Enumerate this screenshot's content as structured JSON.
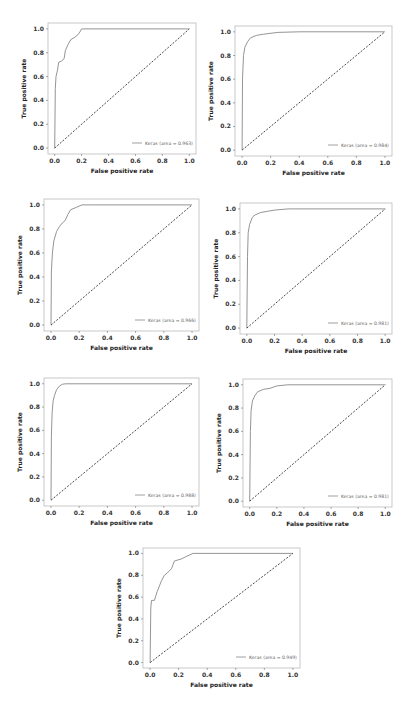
{
  "figure": {
    "x_label": "False positive rate",
    "y_label": "True positive rate",
    "x_ticks": [
      "0.0",
      "0.2",
      "0.4",
      "0.6",
      "0.8",
      "1.0"
    ],
    "y_ticks": [
      "0.0",
      "0.2",
      "0.4",
      "0.6",
      "0.8",
      "1.0"
    ],
    "line_color": "#888888",
    "diagonal_color": "#333333",
    "frame_color": "#bbbbbb"
  },
  "chart_data": [
    {
      "type": "line",
      "title": "",
      "xlabel": "False positive rate",
      "ylabel": "True positive rate",
      "xlim": [
        0,
        1
      ],
      "ylim": [
        0,
        1
      ],
      "legend": "Keras (area = 0.963)",
      "legend_position": "lower right",
      "frame": {
        "left": 48,
        "top": 23,
        "width": 148,
        "height": 131
      },
      "series": [
        {
          "name": "Keras (area = 0.963)",
          "x": [
            0,
            0.005,
            0.01,
            0.02,
            0.03,
            0.05,
            0.07,
            0.08,
            0.1,
            0.12,
            0.15,
            0.18,
            0.2,
            1.0
          ],
          "y": [
            0,
            0.5,
            0.6,
            0.65,
            0.72,
            0.73,
            0.75,
            0.82,
            0.87,
            0.91,
            0.93,
            0.96,
            1.0,
            1.0
          ]
        },
        {
          "name": "chance",
          "x": [
            0,
            1
          ],
          "y": [
            0,
            1
          ],
          "style": "dashed"
        }
      ]
    },
    {
      "type": "line",
      "title": "",
      "xlabel": "False positive rate",
      "ylabel": "True positive rate",
      "xlim": [
        0,
        1
      ],
      "ylim": [
        0,
        1
      ],
      "legend": "Keras (area = 0.984)",
      "legend_position": "lower right",
      "frame": {
        "left": 235,
        "top": 26,
        "width": 157,
        "height": 130
      },
      "series": [
        {
          "name": "Keras (area = 0.984)",
          "x": [
            0,
            0.003,
            0.01,
            0.02,
            0.04,
            0.06,
            0.1,
            0.15,
            0.25,
            0.4,
            1.0
          ],
          "y": [
            0,
            0.6,
            0.8,
            0.87,
            0.92,
            0.95,
            0.97,
            0.98,
            0.995,
            1.0,
            1.0
          ]
        },
        {
          "name": "chance",
          "x": [
            0,
            1
          ],
          "y": [
            0,
            1
          ],
          "style": "dashed"
        }
      ]
    },
    {
      "type": "line",
      "title": "",
      "xlabel": "False positive rate",
      "ylabel": "True positive rate",
      "xlim": [
        0,
        1
      ],
      "ylim": [
        0,
        1
      ],
      "legend": "Keras (area = 0.966)",
      "legend_position": "lower right",
      "frame": {
        "left": 44,
        "top": 199,
        "width": 155,
        "height": 132
      },
      "series": [
        {
          "name": "Keras (area = 0.966)",
          "x": [
            0,
            0.003,
            0.01,
            0.02,
            0.04,
            0.06,
            0.08,
            0.1,
            0.12,
            0.14,
            0.18,
            0.22,
            0.3,
            1.0
          ],
          "y": [
            0,
            0.45,
            0.6,
            0.7,
            0.78,
            0.82,
            0.85,
            0.87,
            0.92,
            0.96,
            0.98,
            1.0,
            1.0,
            1.0
          ]
        },
        {
          "name": "chance",
          "x": [
            0,
            1
          ],
          "y": [
            0,
            1
          ],
          "style": "dashed"
        }
      ]
    },
    {
      "type": "line",
      "title": "",
      "xlabel": "False positive rate",
      "ylabel": "True positive rate",
      "xlim": [
        0,
        1
      ],
      "ylim": [
        0,
        1
      ],
      "legend": "Keras (area = 0.981)",
      "legend_position": "lower right",
      "frame": {
        "left": 240,
        "top": 203,
        "width": 152,
        "height": 131
      },
      "series": [
        {
          "name": "Keras (area = 0.981)",
          "x": [
            0,
            0.005,
            0.01,
            0.02,
            0.04,
            0.06,
            0.1,
            0.15,
            0.2,
            0.3,
            1.0
          ],
          "y": [
            0,
            0.6,
            0.8,
            0.87,
            0.93,
            0.95,
            0.97,
            0.98,
            0.99,
            1.0,
            1.0
          ]
        },
        {
          "name": "chance",
          "x": [
            0,
            1
          ],
          "y": [
            0,
            1
          ],
          "style": "dashed"
        }
      ]
    },
    {
      "type": "line",
      "title": "",
      "xlabel": "False positive rate",
      "ylabel": "True positive rate",
      "xlim": [
        0,
        1
      ],
      "ylim": [
        0,
        1
      ],
      "legend": "Keras (area = 0.988)",
      "legend_position": "lower right",
      "frame": {
        "left": 44,
        "top": 378,
        "width": 155,
        "height": 128
      },
      "series": [
        {
          "name": "Keras (area = 0.988)",
          "x": [
            0,
            0.003,
            0.008,
            0.015,
            0.025,
            0.04,
            0.06,
            0.08,
            0.1,
            1.0
          ],
          "y": [
            0,
            0.55,
            0.75,
            0.85,
            0.9,
            0.95,
            0.98,
            0.995,
            1.0,
            1.0
          ]
        },
        {
          "name": "chance",
          "x": [
            0,
            1
          ],
          "y": [
            0,
            1
          ],
          "style": "dashed"
        }
      ]
    },
    {
      "type": "line",
      "title": "",
      "xlabel": "False positive rate",
      "ylabel": "True positive rate",
      "xlim": [
        0,
        1
      ],
      "ylim": [
        0,
        1
      ],
      "legend": "Keras (area = 0.981)",
      "legend_position": "lower right",
      "frame": {
        "left": 243,
        "top": 379,
        "width": 149,
        "height": 128
      },
      "series": [
        {
          "name": "Keras (area = 0.981)",
          "x": [
            0,
            0.005,
            0.01,
            0.02,
            0.04,
            0.06,
            0.1,
            0.15,
            0.2,
            0.28,
            1.0
          ],
          "y": [
            0,
            0.6,
            0.78,
            0.86,
            0.91,
            0.94,
            0.96,
            0.97,
            0.99,
            1.0,
            1.0
          ]
        },
        {
          "name": "chance",
          "x": [
            0,
            1
          ],
          "y": [
            0,
            1
          ],
          "style": "dashed"
        }
      ]
    },
    {
      "type": "line",
      "title": "",
      "xlabel": "False positive rate",
      "ylabel": "True positive rate",
      "xlim": [
        0,
        1
      ],
      "ylim": [
        0,
        1
      ],
      "legend": "Keras (area = 0.949)",
      "legend_position": "lower right",
      "frame": {
        "left": 143,
        "top": 548,
        "width": 157,
        "height": 120
      },
      "series": [
        {
          "name": "Keras (area = 0.949)",
          "x": [
            0,
            0.005,
            0.01,
            0.03,
            0.05,
            0.08,
            0.1,
            0.12,
            0.15,
            0.17,
            0.22,
            0.25,
            0.3,
            1.0
          ],
          "y": [
            0,
            0.5,
            0.57,
            0.57,
            0.65,
            0.75,
            0.8,
            0.82,
            0.86,
            0.93,
            0.95,
            0.97,
            1.0,
            1.0
          ]
        },
        {
          "name": "chance",
          "x": [
            0,
            1
          ],
          "y": [
            0,
            1
          ],
          "style": "dashed"
        }
      ]
    }
  ]
}
